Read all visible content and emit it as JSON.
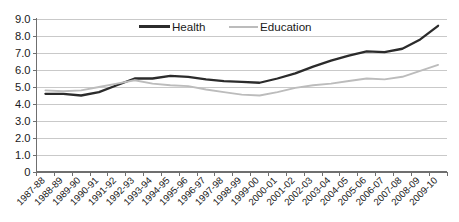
{
  "chart_data": {
    "type": "line",
    "title": "",
    "xlabel": "",
    "ylabel": "",
    "ylim": [
      0,
      9.0
    ],
    "yticks": [
      0,
      1.0,
      2.0,
      3.0,
      4.0,
      5.0,
      6.0,
      7.0,
      8.0,
      9.0
    ],
    "ytick_labels": [
      "0",
      "1.0",
      "2.0",
      "3.0",
      "4.0",
      "5.0",
      "6.0",
      "7.0",
      "8.0",
      "9.0"
    ],
    "grid": "horizontal",
    "legend_position": "top-center",
    "categories": [
      "1987-88",
      "1988-89",
      "1989-90",
      "1990-91",
      "1991-92",
      "1992-93",
      "1993-94",
      "1994-95",
      "1995-96",
      "1996-97",
      "1997-98",
      "1998-99",
      "1999-00",
      "2000-01",
      "2001-02",
      "2002-03",
      "2003-04",
      "2004-05",
      "2005-06",
      "2006-07",
      "2007-08",
      "2008-09",
      "2009-10"
    ],
    "series": [
      {
        "name": "Health",
        "color": "#2b2b2b",
        "values": [
          4.6,
          4.6,
          4.5,
          4.7,
          5.1,
          5.5,
          5.5,
          5.65,
          5.6,
          5.45,
          5.35,
          5.3,
          5.25,
          5.5,
          5.8,
          6.2,
          6.55,
          6.85,
          7.1,
          7.05,
          7.25,
          7.8,
          8.6
        ]
      },
      {
        "name": "Education",
        "color": "#bcbcbc",
        "values": [
          4.8,
          4.75,
          4.8,
          5.0,
          5.2,
          5.4,
          5.2,
          5.1,
          5.05,
          4.85,
          4.7,
          4.55,
          4.5,
          4.7,
          4.95,
          5.1,
          5.2,
          5.35,
          5.5,
          5.45,
          5.6,
          5.95,
          6.3
        ]
      }
    ]
  },
  "legend": {
    "items": [
      {
        "label": "Health"
      },
      {
        "label": "Education"
      }
    ]
  },
  "header": {
    "cropped_title": ""
  }
}
